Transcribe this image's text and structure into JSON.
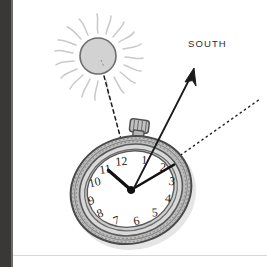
{
  "illustration": {
    "title": "Using a watch and the sun to find south",
    "background_color": "#ffffff",
    "left_edge_color": "#3a3836",
    "rule_color": "#d8d8d8"
  },
  "labels": {
    "south": "SOUTH"
  },
  "sun": {
    "name": "sun",
    "disc_fill": "#d2d2d2",
    "disc_stroke": "#6d6d6d",
    "ray_color": "#c9c9c9",
    "center_x": 98,
    "center_y": 56,
    "radius": 18,
    "ray_count": 18
  },
  "watch": {
    "name": "pocket-watch",
    "case_outer_fill": "#b9b9b9",
    "case_inner_fill": "#d8d8d8",
    "case_stroke": "#5d5d5d",
    "dial_fill": "#ffffff",
    "hand_color": "#111111",
    "center_x": 131,
    "center_y": 190,
    "rotation_deg": -19,
    "hour_numerals": [
      "12",
      "1",
      "2",
      "3",
      "4",
      "5",
      "6",
      "7",
      "8",
      "9",
      "10",
      "11"
    ],
    "hour_hand_points_to": "10",
    "minute_hand_points_to": "3",
    "crown_position": "upper-right"
  },
  "arrow": {
    "name": "south-arrow",
    "color": "#1a1a1a",
    "from": [
      134,
      188
    ],
    "to": [
      194,
      70
    ]
  },
  "dashed_sun_line": {
    "name": "sun-sight-line",
    "color": "#1a1a1a",
    "from": [
      104,
      76
    ],
    "to": [
      134,
      188
    ],
    "style": "dashed"
  },
  "dotted_bisector_line": {
    "name": "hour-hand-bisector-line",
    "color": "#1a1a1a",
    "from": [
      134,
      188
    ],
    "to": [
      258,
      100
    ],
    "style": "dotted"
  }
}
